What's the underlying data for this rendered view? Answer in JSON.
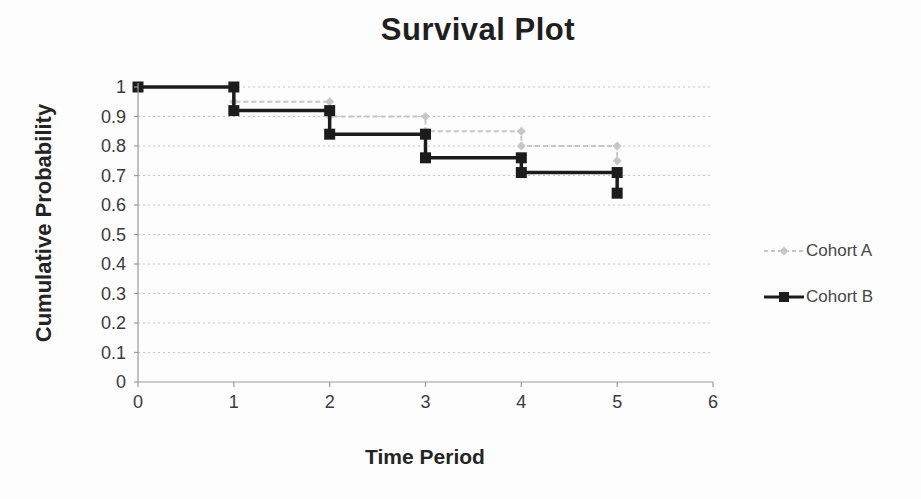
{
  "chart_data": {
    "type": "line",
    "subtype": "step-survival",
    "title": "Survival Plot",
    "xlabel": "Time Period",
    "ylabel": "Cumulative Probability",
    "x": [
      0,
      1,
      2,
      3,
      4,
      5
    ],
    "series": [
      {
        "name": "Cohort A",
        "values": [
          1.0,
          0.95,
          0.9,
          0.85,
          0.8,
          0.75
        ],
        "color": "#c6c6c6",
        "marker": "diamond",
        "line_style": "dashed"
      },
      {
        "name": "Cohort B",
        "values": [
          1.0,
          0.92,
          0.84,
          0.76,
          0.71,
          0.64
        ],
        "color": "#1c1c1c",
        "marker": "square",
        "line_style": "solid"
      }
    ],
    "x_ticks": [
      "0",
      "1",
      "2",
      "3",
      "4",
      "5",
      "6"
    ],
    "y_ticks": [
      "1",
      "0.9",
      "0.8",
      "0.7",
      "0.6",
      "0.5",
      "0.4",
      "0.3",
      "0.2",
      "0.1",
      "0"
    ],
    "xlim": [
      0,
      6
    ],
    "ylim": [
      0,
      1
    ],
    "grid": "horizontal dotted",
    "grid_color": "#c4c4c4",
    "axis_color": "#9a9a9a",
    "legend_position": "right"
  }
}
